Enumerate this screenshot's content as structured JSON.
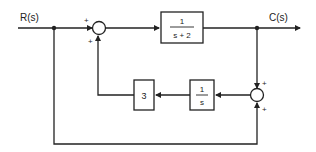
{
  "diagram": {
    "type": "block-diagram",
    "input_label": "R(s)",
    "output_label": "C(s)",
    "blocks": {
      "forward": {
        "numerator": "1",
        "denominator": "s + 2"
      },
      "integrator": {
        "numerator": "1",
        "denominator": "s"
      },
      "gain": {
        "value": "3"
      }
    },
    "summing_junctions": {
      "sum1": {
        "signs": [
          "+",
          "+"
        ]
      },
      "sum2": {
        "signs": [
          "+",
          "+"
        ]
      }
    },
    "colors": {
      "line": "#222222",
      "background": "#ffffff"
    }
  }
}
